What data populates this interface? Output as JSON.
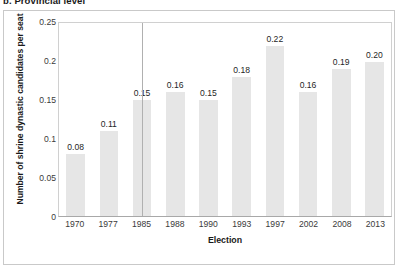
{
  "caption": "b. Provincial level",
  "chart_data": {
    "type": "bar",
    "title": "",
    "xlabel": "Election",
    "ylabel": "Number of shrine dynastic candidates per seat",
    "categories": [
      "1970",
      "1977",
      "1985",
      "1988",
      "1990",
      "1993",
      "1997",
      "2002",
      "2008",
      "2013"
    ],
    "values": [
      0.08,
      0.11,
      0.15,
      0.16,
      0.15,
      0.18,
      0.22,
      0.16,
      0.19,
      0.2
    ],
    "value_labels": [
      "0.08",
      "0.11",
      "0.15",
      "0.16",
      "0.15",
      "0.18",
      "0.22",
      "0.16",
      "0.19",
      "0.20"
    ],
    "ylim": [
      0,
      0.25
    ],
    "ytick_labels": [
      "0",
      "0.05",
      "0.1",
      "0.15",
      "0.2",
      "0.25"
    ],
    "ytick_values": [
      0,
      0.05,
      0.1,
      0.15,
      0.2,
      0.25
    ],
    "grid": false,
    "legend": "none",
    "bar_color": "#e6e6e6",
    "annotations": [
      {
        "name": "marker-line",
        "category": "1985",
        "type": "vertical-line",
        "color": "#b0b0b0"
      }
    ]
  }
}
